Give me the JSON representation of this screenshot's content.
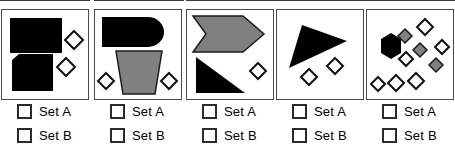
{
  "page": {
    "panel_count": 5,
    "colors": {
      "black": "#000000",
      "gray": "#808080",
      "white": "#ffffff",
      "outline": "#1a1a1a",
      "panel_border": "#4a4a4a",
      "background": "#ffffff"
    }
  },
  "answer_options": [
    {
      "id": "set-a",
      "label": "Set A",
      "checked": false
    },
    {
      "id": "set-b",
      "label": "Set B",
      "checked": false
    }
  ],
  "panels": [
    {
      "index": 1,
      "name": "panel-1",
      "shapes": [
        {
          "kind": "rectangle",
          "fill": "black",
          "note": "large black rectangle, upper left"
        },
        {
          "kind": "pentagon",
          "fill": "black",
          "note": "black square with cut top-left corner, lower left"
        },
        {
          "kind": "diamond",
          "fill": "white",
          "note": "small white diamond, upper right"
        },
        {
          "kind": "diamond",
          "fill": "white",
          "note": "small white diamond, middle right"
        }
      ],
      "counts": {
        "black": 2,
        "gray": 0,
        "white_diamonds": 2
      },
      "answers": [
        {
          "id": "p1-set-a",
          "label": "Set A",
          "checked": false
        },
        {
          "id": "p1-set-b",
          "label": "Set B",
          "checked": false
        }
      ]
    },
    {
      "index": 2,
      "name": "panel-2",
      "shapes": [
        {
          "kind": "bullet",
          "fill": "black",
          "note": "black rounded-right bullet shape, top"
        },
        {
          "kind": "trapezoid",
          "fill": "gray",
          "note": "gray inverted trapezoid, bottom center"
        },
        {
          "kind": "diamond",
          "fill": "white",
          "note": "small white diamond, bottom left"
        },
        {
          "kind": "diamond",
          "fill": "white",
          "note": "small white diamond, bottom right"
        }
      ],
      "counts": {
        "black": 1,
        "gray": 1,
        "white_diamonds": 2
      },
      "answers": [
        {
          "id": "p2-set-a",
          "label": "Set A",
          "checked": false
        },
        {
          "id": "p2-set-b",
          "label": "Set B",
          "checked": false
        }
      ]
    },
    {
      "index": 3,
      "name": "panel-3",
      "shapes": [
        {
          "kind": "chevron",
          "fill": "gray",
          "note": "gray right-pointing chevron/arrow, top"
        },
        {
          "kind": "right-triangle",
          "fill": "black",
          "note": "black right triangle, bottom left"
        },
        {
          "kind": "diamond",
          "fill": "white",
          "note": "small white diamond, middle right"
        }
      ],
      "counts": {
        "black": 1,
        "gray": 1,
        "white_diamonds": 1
      },
      "answers": [
        {
          "id": "p3-set-a",
          "label": "Set A",
          "checked": false
        },
        {
          "id": "p3-set-b",
          "label": "Set B",
          "checked": false
        }
      ]
    },
    {
      "index": 4,
      "name": "panel-4",
      "shapes": [
        {
          "kind": "triangle",
          "fill": "black",
          "note": "black scalene triangle, upper center"
        },
        {
          "kind": "diamond",
          "fill": "white",
          "note": "small white diamond, lower left"
        },
        {
          "kind": "diamond",
          "fill": "white",
          "note": "small white diamond, lower right"
        }
      ],
      "counts": {
        "black": 1,
        "gray": 0,
        "white_diamonds": 2
      },
      "answers": [
        {
          "id": "p4-set-a",
          "label": "Set A",
          "checked": false
        },
        {
          "id": "p4-set-b",
          "label": "Set B",
          "checked": false
        }
      ]
    },
    {
      "index": 5,
      "name": "panel-5",
      "shapes": [
        {
          "kind": "hexagon",
          "fill": "black",
          "note": "black hexagon, left center"
        },
        {
          "kind": "diamond",
          "fill": "gray",
          "note": "gray diamond, upper middle"
        },
        {
          "kind": "diamond",
          "fill": "gray",
          "note": "gray diamond, center"
        },
        {
          "kind": "diamond",
          "fill": "gray",
          "note": "gray diamond, right lower"
        },
        {
          "kind": "diamond",
          "fill": "white",
          "note": "white diamond, top right"
        },
        {
          "kind": "diamond",
          "fill": "white",
          "note": "white diamond, right edge"
        },
        {
          "kind": "diamond",
          "fill": "white",
          "note": "white diamond, below hexagon right"
        },
        {
          "kind": "diamond",
          "fill": "white",
          "note": "white diamond, bottom row left"
        },
        {
          "kind": "diamond",
          "fill": "white",
          "note": "white diamond, bottom row middle"
        },
        {
          "kind": "diamond",
          "fill": "white",
          "note": "white diamond, bottom row right"
        }
      ],
      "counts": {
        "black": 1,
        "gray": 3,
        "white_diamonds": 6
      },
      "answers": [
        {
          "id": "p5-set-a",
          "label": "Set A",
          "checked": false
        },
        {
          "id": "p5-set-b",
          "label": "Set B",
          "checked": false
        }
      ]
    }
  ]
}
